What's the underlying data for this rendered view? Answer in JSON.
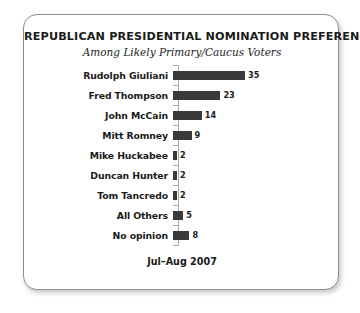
{
  "chart_data": {
    "type": "bar",
    "orientation": "horizontal",
    "title": "REPUBLICAN PRESIDENTIAL NOMINATION PREFERENCES",
    "subtitle": "Among Likely Primary/Caucus Voters",
    "footer": "Jul–Aug 2007",
    "categories": [
      "Rudolph Giuliani",
      "Fred Thompson",
      "John McCain",
      "Mitt Romney",
      "Mike Huckabee",
      "Duncan Hunter",
      "Tom Tancredo",
      "All Others",
      "No opinion"
    ],
    "values": [
      35,
      23,
      14,
      9,
      2,
      2,
      2,
      5,
      8
    ],
    "xlabel": "",
    "ylabel": "",
    "xlim": [
      0,
      35
    ],
    "grid": false,
    "legend": false,
    "bar_color": "#3a3a3a",
    "axis_color": "#a8a8a8",
    "px_per_unit": 2.06
  }
}
